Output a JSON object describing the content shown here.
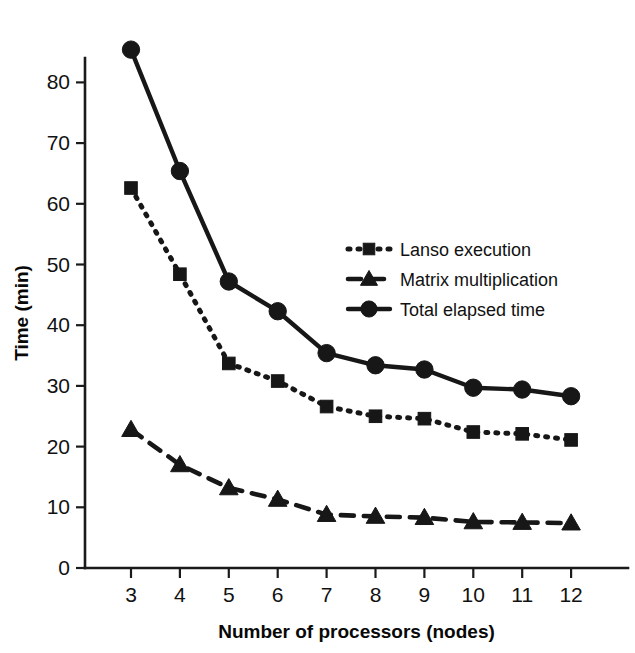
{
  "chart_data": {
    "type": "line",
    "title": "",
    "xlabel": "Number of processors (nodes)",
    "ylabel": "Time (min)",
    "x": [
      3,
      4,
      5,
      6,
      7,
      8,
      9,
      10,
      11,
      12
    ],
    "xticklabels": [
      "3",
      "4",
      "5",
      "6",
      "7",
      "8",
      "9",
      "10",
      "11",
      "12"
    ],
    "yticks": [
      0,
      10,
      20,
      30,
      40,
      50,
      60,
      70,
      80
    ],
    "yticklabels": [
      "0",
      "10",
      "20",
      "30",
      "40",
      "50",
      "60",
      "70",
      "80"
    ],
    "xlim": [
      2.5,
      12.7
    ],
    "ylim": [
      0,
      88
    ],
    "grid": false,
    "legend_position": "center-right",
    "series": [
      {
        "name": "Lanso execution",
        "marker": "square",
        "linestyle": "dotted",
        "color": "#171717",
        "values": [
          62.6,
          48.4,
          33.7,
          30.8,
          26.6,
          25.0,
          24.6,
          22.4,
          22.1,
          21.1
        ]
      },
      {
        "name": "Matrix multiplication",
        "marker": "triangle",
        "linestyle": "dashed",
        "color": "#171717",
        "values": [
          22.8,
          17.0,
          13.2,
          11.3,
          8.8,
          8.5,
          8.3,
          7.6,
          7.5,
          7.4
        ]
      },
      {
        "name": "Total elapsed time",
        "marker": "circle",
        "linestyle": "solid",
        "color": "#171717",
        "values": [
          85.4,
          65.4,
          47.2,
          42.3,
          35.4,
          33.4,
          32.7,
          29.7,
          29.4,
          28.3
        ]
      }
    ]
  },
  "legend": {
    "entries": [
      {
        "label": "Lanso execution"
      },
      {
        "label": "Matrix multiplication"
      },
      {
        "label": "Total elapsed time"
      }
    ]
  }
}
